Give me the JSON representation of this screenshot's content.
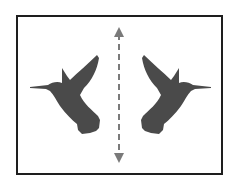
{
  "diagram": {
    "title": "",
    "colors": {
      "frame": "#1e1e1e",
      "bird": "#4a4a4a",
      "axis": "#7a7a7a",
      "background": "#ffffff"
    },
    "elements": [
      {
        "name": "left-hummingbird",
        "facing": "left"
      },
      {
        "name": "symmetry-axis",
        "style": "dashed",
        "arrowheads": "both"
      },
      {
        "name": "right-hummingbird",
        "facing": "right"
      }
    ]
  }
}
